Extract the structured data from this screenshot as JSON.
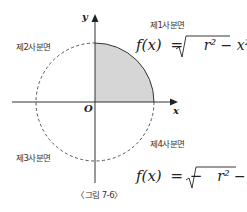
{
  "figure": {
    "caption": "〈그림 7-6〉",
    "axes": {
      "x_label": "x",
      "y_label": "y",
      "origin_label": "O"
    },
    "quadrants": {
      "q1": "제1사분면",
      "q2": "제2사분면",
      "q3": "제3사분면",
      "q4": "제4사분면"
    },
    "equations": {
      "upper": {
        "lhs": "f(x)",
        "eq": "=",
        "neg": "",
        "radicand": "r² − x²"
      },
      "lower": {
        "lhs": "f(x)",
        "eq": "=",
        "neg": "−",
        "radicand": "r² − x²"
      }
    },
    "colors": {
      "shade": "#d6d6d6",
      "line": "#333333"
    }
  }
}
